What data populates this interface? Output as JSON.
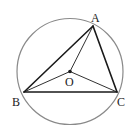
{
  "diagram": {
    "type": "circle-inscribed-triangle",
    "circle": {
      "cx": 70,
      "cy": 71.5,
      "r": 53,
      "stroke": "#8a8a8a"
    },
    "points": {
      "A": {
        "x": 93,
        "y": 26,
        "label": "A",
        "lx": 91,
        "ly": 22
      },
      "B": {
        "x": 24,
        "y": 92,
        "label": "B",
        "lx": 12,
        "ly": 106
      },
      "C": {
        "x": 117,
        "y": 92,
        "label": "C",
        "lx": 117,
        "ly": 106
      },
      "O": {
        "x": 70,
        "y": 71.5,
        "label": "O",
        "lx": 65,
        "ly": 86
      }
    },
    "segments": [
      {
        "from": "A",
        "to": "B",
        "weight": "thick"
      },
      {
        "from": "B",
        "to": "C",
        "weight": "thick"
      },
      {
        "from": "C",
        "to": "A",
        "weight": "thick"
      },
      {
        "from": "O",
        "to": "A",
        "weight": "thin"
      },
      {
        "from": "O",
        "to": "B",
        "weight": "thin"
      },
      {
        "from": "O",
        "to": "C",
        "weight": "thin"
      }
    ],
    "colors": {
      "line": "#1a1a1a",
      "circle": "#8a8a8a",
      "label": "#222222"
    }
  }
}
